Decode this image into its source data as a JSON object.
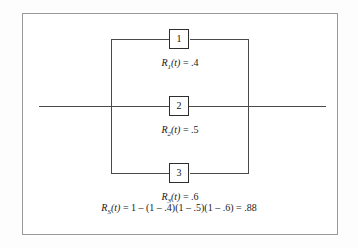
{
  "diagram": {
    "type": "reliability-block-diagram",
    "configuration": "parallel",
    "frame": {
      "border_color": "#9a9a9a",
      "background": "#ffffff"
    },
    "line_color": "#4a4a4a",
    "box_border_color": "#2e2e2e"
  },
  "branches": [
    {
      "id": "branch-1",
      "box_number": "1",
      "label_symbol": "R",
      "label_subscript": "1",
      "label_arg": "(t)",
      "label_equals": " = ",
      "label_value": ".4",
      "label_full": "R1(t) = .4",
      "reliability": 0.4,
      "rail_y": 38
    },
    {
      "id": "branch-2",
      "box_number": "2",
      "label_symbol": "R",
      "label_subscript": "2",
      "label_arg": "(t)",
      "label_equals": " = ",
      "label_value": ".5",
      "label_full": "R2(t) = .5",
      "reliability": 0.5,
      "rail_y": 105
    },
    {
      "id": "branch-3",
      "box_number": "3",
      "label_symbol": "R",
      "label_subscript": "3",
      "label_arg": "(t)",
      "label_equals": " = ",
      "label_value": ".6",
      "label_full": "R3(t) = .6",
      "reliability": 0.6,
      "rail_y": 172
    }
  ],
  "system": {
    "symbol": "R",
    "subscript": "S",
    "arg": "(t)",
    "expression": " = 1 – (1 – .4)(1 – .5)(1 – .6) = .88",
    "formula_full": "RS(t) = 1 – (1 – .4)(1 – .5)(1 – .6) = .88",
    "result": 0.88
  }
}
